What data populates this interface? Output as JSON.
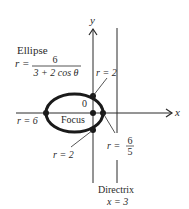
{
  "diagram": {
    "axes": {
      "x_label": "x",
      "y_label": "y",
      "origin_label": "0"
    },
    "ellipse": {
      "title": "Ellipse",
      "equation_lhs": "r =",
      "equation_numerator": "6",
      "equation_denominator": "3 + 2 cos θ"
    },
    "focus_label": "Focus",
    "annotations": {
      "r_top": "r = 2",
      "r_bottom": "r = 2",
      "r_left": "r = 6",
      "r_right_lhs": "r =",
      "r_right_num": "6",
      "r_right_den": "5"
    },
    "directrix": {
      "label": "Directrix",
      "equation": "x = 3"
    },
    "colors": {
      "ink": "#2a2a2a",
      "background": "#ffffff"
    }
  }
}
